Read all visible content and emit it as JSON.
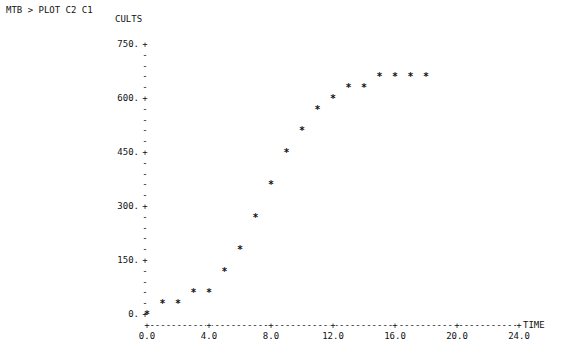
{
  "prompt": "MTB > PLOT C2 C1",
  "chart_data": {
    "type": "scatter",
    "title": "",
    "xlabel": "TIME",
    "ylabel": "CULTS",
    "xlim": [
      0,
      24
    ],
    "ylim": [
      0,
      750
    ],
    "grid": false,
    "marker": "*",
    "x_ticks": [
      "0.0",
      "4.0",
      "8.0",
      "12.0",
      "16.0",
      "20.0",
      "24.0"
    ],
    "y_ticks": [
      "0.",
      "150.",
      "300.",
      "450.",
      "600.",
      "750."
    ],
    "series": [
      {
        "name": "C2 vs C1",
        "x": [
          0,
          1,
          2,
          3,
          4,
          5,
          6,
          7,
          8,
          9,
          10,
          11,
          12,
          13,
          14,
          15,
          16,
          17,
          18
        ],
        "y": [
          0,
          30,
          30,
          60,
          60,
          120,
          180,
          270,
          360,
          450,
          510,
          570,
          600,
          630,
          630,
          660,
          660,
          660,
          660
        ]
      }
    ]
  }
}
